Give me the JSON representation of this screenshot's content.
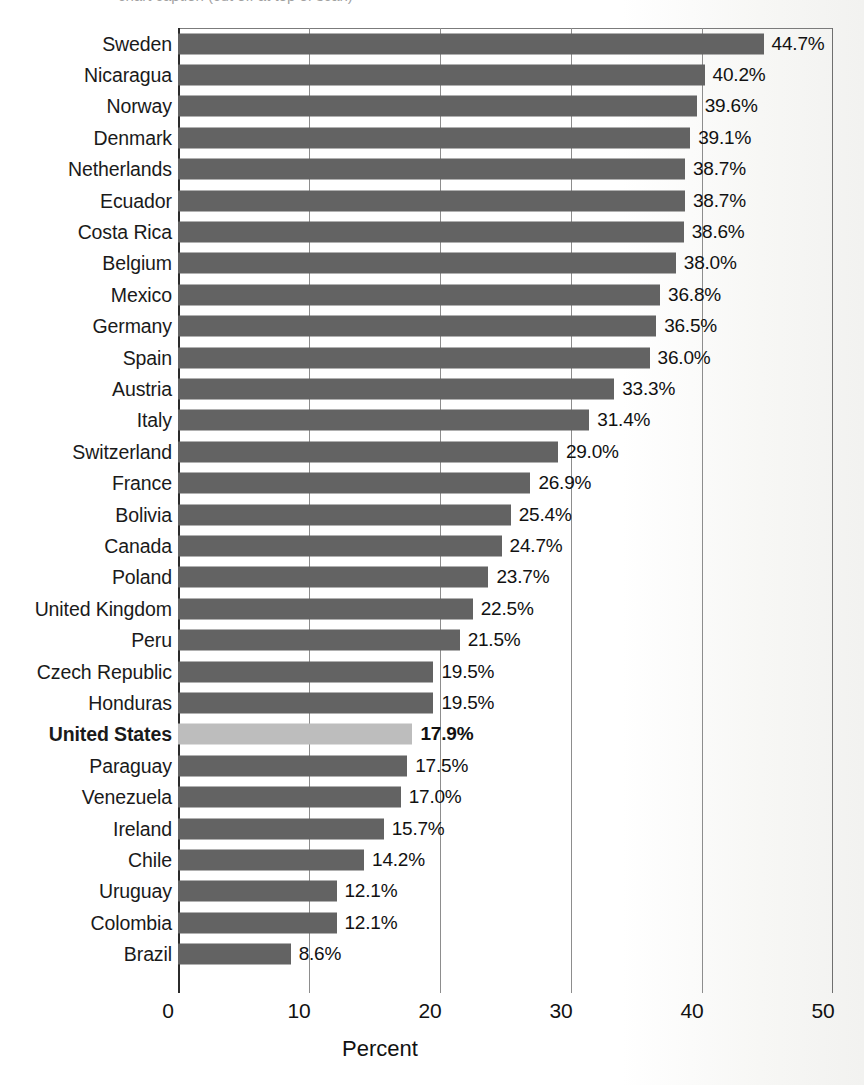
{
  "top_cut_caption": "chart caption (cut off at top of scan)",
  "chart_data": {
    "type": "bar",
    "orientation": "horizontal",
    "title": "",
    "xlabel": "Percent",
    "ylabel": "",
    "xlim": [
      0,
      50
    ],
    "xticks": [
      0,
      10,
      20,
      30,
      40,
      50
    ],
    "xtick_labels": [
      "0",
      "10",
      "20",
      "30",
      "40",
      "50"
    ],
    "grid": true,
    "grid_axis": "x",
    "legend": false,
    "value_suffix": "%",
    "bar_color": "#636363",
    "highlight_color": "#bdbdbd",
    "highlight_category": "United States",
    "categories": [
      "Sweden",
      "Nicaragua",
      "Norway",
      "Denmark",
      "Netherlands",
      "Ecuador",
      "Costa Rica",
      "Belgium",
      "Mexico",
      "Germany",
      "Spain",
      "Austria",
      "Italy",
      "Switzerland",
      "France",
      "Bolivia",
      "Canada",
      "Poland",
      "United Kingdom",
      "Peru",
      "Czech Republic",
      "Honduras",
      "United States",
      "Paraguay",
      "Venezuela",
      "Ireland",
      "Chile",
      "Uruguay",
      "Colombia",
      "Brazil"
    ],
    "values": [
      44.7,
      40.2,
      39.6,
      39.1,
      38.7,
      38.7,
      38.6,
      38.0,
      36.8,
      36.5,
      36.0,
      33.3,
      31.4,
      29.0,
      26.9,
      25.4,
      24.7,
      23.7,
      22.5,
      21.5,
      19.5,
      19.5,
      17.9,
      17.5,
      17.0,
      15.7,
      14.2,
      12.1,
      12.1,
      8.6
    ],
    "value_labels": [
      "44.7%",
      "40.2%",
      "39.6%",
      "39.1%",
      "38.7%",
      "38.7%",
      "38.6%",
      "38.0%",
      "36.8%",
      "36.5%",
      "36.0%",
      "33.3%",
      "31.4%",
      "29.0%",
      "26.9%",
      "25.4%",
      "24.7%",
      "23.7%",
      "22.5%",
      "21.5%",
      "19.5%",
      "19.5%",
      "17.9%",
      "17.5%",
      "17.0%",
      "15.7%",
      "14.2%",
      "12.1%",
      "12.1%",
      "8.6%"
    ]
  }
}
